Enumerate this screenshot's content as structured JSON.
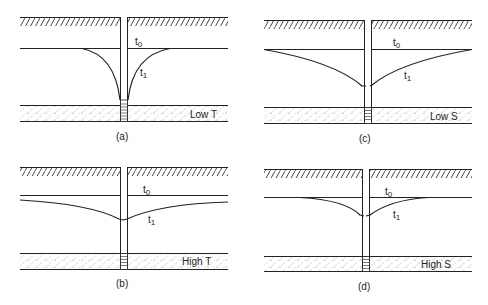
{
  "figure": {
    "panels": [
      {
        "id": "a",
        "caption": "(a)",
        "aquifer_label": "Low T",
        "t0": "t",
        "t0_sub": "0",
        "t1": "t",
        "t1_sub": "1"
      },
      {
        "id": "c",
        "caption": "(c)",
        "aquifer_label": "Low S",
        "t0": "t",
        "t0_sub": "0",
        "t1": "t",
        "t1_sub": "1"
      },
      {
        "id": "b",
        "caption": "(b)",
        "aquifer_label": "High T",
        "t0": "t",
        "t0_sub": "0",
        "t1": "t",
        "t1_sub": "1"
      },
      {
        "id": "d",
        "caption": "(d)",
        "aquifer_label": "High S",
        "t0": "t",
        "t0_sub": "0",
        "t1": "t",
        "t1_sub": "1"
      }
    ],
    "colors": {
      "line": "#222222",
      "background": "#ffffff"
    }
  }
}
